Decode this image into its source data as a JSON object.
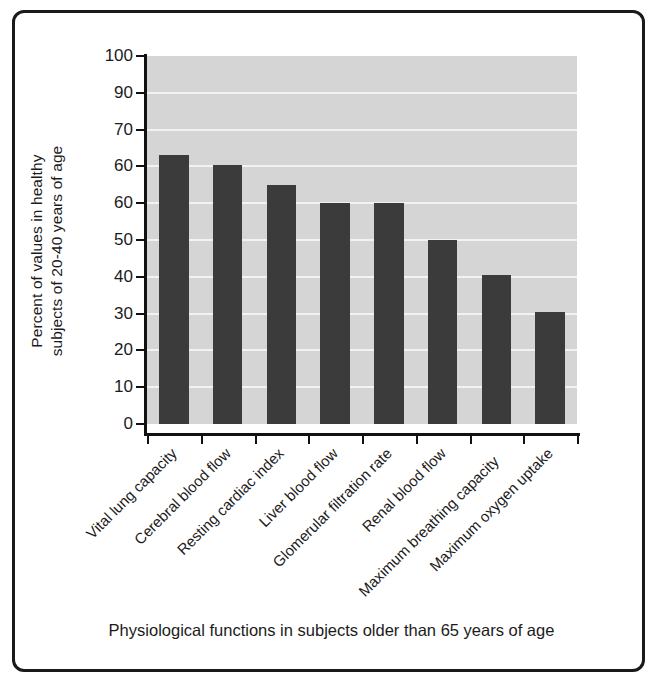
{
  "figure": {
    "caption": "Physiological functions in subjects older than 65 years of age",
    "y_axis_title_line1": "Percent of values in healthy",
    "y_axis_title_line2": "subjects of 20-40 years of age"
  },
  "colors": {
    "bar": "#3b3b3b",
    "plot_background": "#d5d5d5",
    "gridline": "#f2f2f2",
    "axis": "#111111",
    "frame": "#1a1a1a",
    "text": "#1b1b1b"
  },
  "chart_data": {
    "type": "bar",
    "title": "",
    "subtitle": "",
    "xlabel": "Physiological functions in subjects older than 65 years of age",
    "ylabel": "Percent of values in healthy subjects of 20-40 years of age",
    "ylim": [
      0,
      100
    ],
    "grid": true,
    "legend": "none",
    "y_tick_labels": [
      "100",
      "90",
      "70",
      "60",
      "60",
      "50",
      "40",
      "30",
      "20",
      "10",
      "0"
    ],
    "y_tick_values": [
      100,
      90,
      80,
      70,
      60,
      50,
      40,
      30,
      20,
      10,
      0
    ],
    "categories": [
      "Vital lung capacity",
      "Cerebral blood flow",
      "Resting cardiac index",
      "Liver blood flow",
      "Glomerular filtration rate",
      "Renal blood flow",
      "Maximum breathing capacity",
      "Maximum oxygen uptake"
    ],
    "values": [
      73,
      70.5,
      65,
      60,
      60,
      50,
      40.5,
      30.5
    ]
  }
}
